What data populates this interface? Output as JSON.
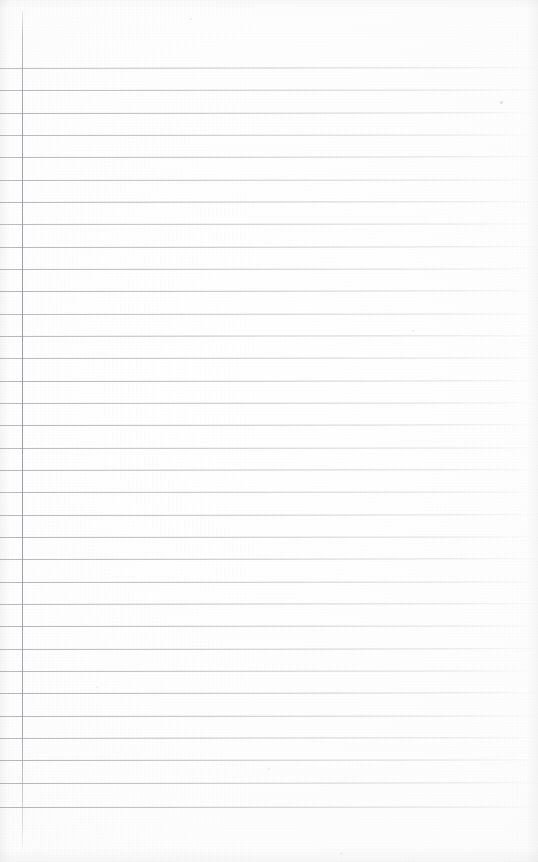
{
  "document": {
    "kind": "scanned-ruled-notebook-page",
    "description": "Blank lined notebook page, no handwriting or printed text",
    "written_content": "",
    "page_width": 538,
    "page_height": 862,
    "background_color": "#fdfdfd"
  },
  "ruling": {
    "line_color": "#8a8c92",
    "line_color_faded": "#c4c6ca",
    "line_thickness": 1,
    "line_count": 34,
    "first_line_y": 68,
    "line_spacing": 22.4,
    "last_line_y": 807,
    "line_start_x": 0,
    "line_end_x": 532,
    "lines": [
      {
        "index": 1,
        "y": 68,
        "x": 0,
        "width": 532,
        "tilt": -0.09,
        "opacity": 0.82
      },
      {
        "index": 2,
        "y": 90,
        "x": 0,
        "width": 534,
        "tilt": -0.07,
        "opacity": 0.86
      },
      {
        "index": 3,
        "y": 113,
        "x": 0,
        "width": 533,
        "tilt": -0.08,
        "opacity": 0.88
      },
      {
        "index": 4,
        "y": 135,
        "x": 0,
        "width": 531,
        "tilt": -0.06,
        "opacity": 0.84
      },
      {
        "index": 5,
        "y": 157,
        "x": 0,
        "width": 534,
        "tilt": -0.08,
        "opacity": 0.87
      },
      {
        "index": 6,
        "y": 180,
        "x": 0,
        "width": 532,
        "tilt": -0.07,
        "opacity": 0.85
      },
      {
        "index": 7,
        "y": 202,
        "x": 0,
        "width": 533,
        "tilt": -0.09,
        "opacity": 0.9
      },
      {
        "index": 8,
        "y": 224,
        "x": 0,
        "width": 531,
        "tilt": -0.06,
        "opacity": 0.83
      },
      {
        "index": 9,
        "y": 247,
        "x": 0,
        "width": 534,
        "tilt": -0.08,
        "opacity": 0.88
      },
      {
        "index": 10,
        "y": 269,
        "x": 0,
        "width": 532,
        "tilt": -0.07,
        "opacity": 0.86
      },
      {
        "index": 11,
        "y": 291,
        "x": 0,
        "width": 533,
        "tilt": -0.08,
        "opacity": 0.89
      },
      {
        "index": 12,
        "y": 314,
        "x": 0,
        "width": 531,
        "tilt": -0.06,
        "opacity": 0.84
      },
      {
        "index": 13,
        "y": 336,
        "x": 0,
        "width": 534,
        "tilt": -0.09,
        "opacity": 0.87
      },
      {
        "index": 14,
        "y": 358,
        "x": 0,
        "width": 532,
        "tilt": -0.07,
        "opacity": 0.85
      },
      {
        "index": 15,
        "y": 381,
        "x": 0,
        "width": 533,
        "tilt": -0.08,
        "opacity": 0.9
      },
      {
        "index": 16,
        "y": 403,
        "x": 0,
        "width": 531,
        "tilt": -0.06,
        "opacity": 0.86
      },
      {
        "index": 17,
        "y": 425,
        "x": 0,
        "width": 534,
        "tilt": -0.08,
        "opacity": 0.88
      },
      {
        "index": 18,
        "y": 448,
        "x": 0,
        "width": 532,
        "tilt": -0.07,
        "opacity": 0.84
      },
      {
        "index": 19,
        "y": 470,
        "x": 0,
        "width": 533,
        "tilt": -0.09,
        "opacity": 0.89
      },
      {
        "index": 20,
        "y": 492,
        "x": 0,
        "width": 531,
        "tilt": -0.06,
        "opacity": 0.85
      },
      {
        "index": 21,
        "y": 515,
        "x": 0,
        "width": 534,
        "tilt": -0.08,
        "opacity": 0.87
      },
      {
        "index": 22,
        "y": 537,
        "x": 0,
        "width": 532,
        "tilt": -0.07,
        "opacity": 0.9
      },
      {
        "index": 23,
        "y": 559,
        "x": 0,
        "width": 533,
        "tilt": -0.08,
        "opacity": 0.86
      },
      {
        "index": 24,
        "y": 582,
        "x": 0,
        "width": 531,
        "tilt": -0.06,
        "opacity": 0.88
      },
      {
        "index": 25,
        "y": 604,
        "x": 0,
        "width": 534,
        "tilt": -0.09,
        "opacity": 0.85
      },
      {
        "index": 26,
        "y": 626,
        "x": 0,
        "width": 532,
        "tilt": -0.07,
        "opacity": 0.89
      },
      {
        "index": 27,
        "y": 649,
        "x": 0,
        "width": 533,
        "tilt": -0.08,
        "opacity": 0.87
      },
      {
        "index": 28,
        "y": 671,
        "x": 0,
        "width": 531,
        "tilt": -0.06,
        "opacity": 0.86
      },
      {
        "index": 29,
        "y": 693,
        "x": 0,
        "width": 534,
        "tilt": -0.08,
        "opacity": 0.9
      },
      {
        "index": 30,
        "y": 716,
        "x": 0,
        "width": 532,
        "tilt": -0.07,
        "opacity": 0.88
      },
      {
        "index": 31,
        "y": 738,
        "x": 0,
        "width": 533,
        "tilt": -0.09,
        "opacity": 0.86
      },
      {
        "index": 32,
        "y": 760,
        "x": 0,
        "width": 531,
        "tilt": -0.06,
        "opacity": 0.89
      },
      {
        "index": 33,
        "y": 783,
        "x": 0,
        "width": 534,
        "tilt": -0.08,
        "opacity": 0.87
      },
      {
        "index": 34,
        "y": 807,
        "x": 0,
        "width": 532,
        "tilt": -0.07,
        "opacity": 0.9
      }
    ]
  },
  "margin_rule": {
    "orientation": "vertical",
    "x": 22,
    "top_y": 10,
    "bottom_y": 850,
    "height": 840,
    "color": "#86888f",
    "thickness": 1
  },
  "specks": [
    {
      "x": 500,
      "y": 101,
      "size": 3,
      "color": "rgba(150,152,158,0.28)"
    },
    {
      "x": 190,
      "y": 18,
      "size": 2,
      "color": "rgba(160,162,168,0.20)"
    },
    {
      "x": 412,
      "y": 330,
      "size": 2,
      "color": "rgba(165,167,172,0.18)"
    },
    {
      "x": 96,
      "y": 686,
      "size": 2,
      "color": "rgba(158,160,166,0.16)"
    },
    {
      "x": 340,
      "y": 852,
      "size": 3,
      "color": "rgba(170,172,177,0.14)"
    },
    {
      "x": 268,
      "y": 768,
      "size": 2,
      "color": "rgba(162,164,170,0.15)"
    }
  ]
}
